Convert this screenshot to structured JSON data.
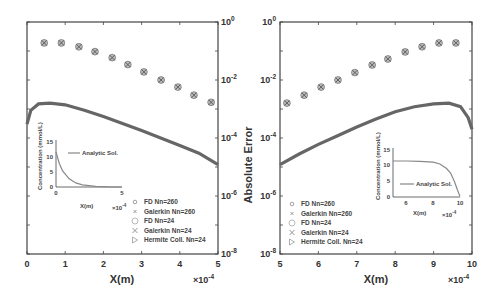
{
  "chart_data": [
    {
      "type": "scatter",
      "panel": "left",
      "xlabel": "X(m)",
      "x_multiplier": "×10^-4",
      "ylabel": "Absolute Error",
      "y_scale": "log",
      "xlim": [
        0,
        5
      ],
      "ylim": [
        1e-08,
        1
      ],
      "x_ticks": [
        "0",
        "1",
        "2",
        "3",
        "4",
        "5"
      ],
      "y_ticks": [
        "10^0",
        "10^-2",
        "10^-4",
        "10^-6",
        "10^-8"
      ],
      "legend": [
        "FD Nn=260",
        "Galerkin Nn=260",
        "FD Nn=24",
        "Galerkin Nn=24",
        "Hermite Coll. Nn=24"
      ],
      "legend_position": "lower right",
      "series": [
        {
          "name": "FD Nn=24 / Galerkin Nn=24 (overlapping)",
          "x": [
            0.45,
            0.9,
            1.36,
            1.78,
            2.23,
            2.64,
            3.06,
            3.51,
            3.95,
            4.37,
            4.82
          ],
          "y": [
            0.19,
            0.19,
            0.14,
            0.095,
            0.059,
            0.034,
            0.019,
            0.01,
            0.0057,
            0.003,
            0.0017
          ]
        },
        {
          "name": "FD Nn=260 / Galerkin Nn=260 / Hermite Coll. Nn=24 (dense curve)",
          "x": [
            0.0,
            0.1,
            0.3,
            0.6,
            1.0,
            1.5,
            2.0,
            2.5,
            3.0,
            3.5,
            4.0,
            4.5,
            5.0
          ],
          "y": [
            0.0003,
            0.0009,
            0.0015,
            0.0016,
            0.0014,
            0.0009,
            0.00055,
            0.00032,
            0.00018,
            0.0001,
            5.5e-05,
            3e-05,
            1.2e-05
          ]
        }
      ],
      "inset": {
        "xlabel": "X(m)",
        "x_multiplier": "×10^-4",
        "ylabel": "Concentration (mmol/L)",
        "x_ticks": [
          "0",
          "5"
        ],
        "y_ticks": [
          "0",
          "5",
          "10",
          "15"
        ],
        "legend": [
          "Analytic Sol."
        ],
        "curve": {
          "x": [
            0,
            0.25,
            0.5,
            1,
            1.5,
            2,
            3,
            4,
            5
          ],
          "y": [
            12,
            8,
            5.5,
            2.8,
            1.4,
            0.7,
            0.2,
            0.05,
            0.01
          ]
        }
      }
    },
    {
      "type": "scatter",
      "panel": "right",
      "xlabel": "X(m)",
      "x_multiplier": "×10^-4",
      "ylabel": "Absolute Error",
      "y_scale": "log",
      "xlim": [
        5,
        10
      ],
      "ylim": [
        1e-08,
        1
      ],
      "x_ticks": [
        "5",
        "6",
        "7",
        "8",
        "9",
        "10"
      ],
      "y_ticks": [
        "10^0",
        "10^-2",
        "10^-4",
        "10^-6",
        "10^-8"
      ],
      "legend": [
        "FD Nn=260",
        "Galerkin Nn=260",
        "FD Nn=24",
        "Galerkin Nn=24",
        "Hermite Coll. Nn=24"
      ],
      "legend_position": "lower left",
      "series": [
        {
          "name": "FD Nn=24 / Galerkin Nn=24 (overlapping)",
          "x": [
            5.18,
            5.63,
            6.07,
            6.51,
            6.95,
            7.4,
            7.81,
            8.26,
            8.7,
            9.14,
            9.58
          ],
          "y": [
            0.0016,
            0.003,
            0.0057,
            0.01,
            0.018,
            0.033,
            0.053,
            0.093,
            0.14,
            0.19,
            0.19
          ]
        },
        {
          "name": "FD Nn=260 / Galerkin Nn=260 / Hermite Coll. Nn=24 (dense curve)",
          "x": [
            5.0,
            5.5,
            6.0,
            6.5,
            7.0,
            7.5,
            8.0,
            8.5,
            9.0,
            9.4,
            9.7,
            9.9,
            10.0
          ],
          "y": [
            1.2e-05,
            2.8e-05,
            6e-05,
            0.00012,
            0.00024,
            0.00045,
            0.0008,
            0.0012,
            0.0015,
            0.0016,
            0.0012,
            0.0005,
            0.0002
          ]
        }
      ],
      "inset": {
        "xlabel": "X(m)",
        "x_multiplier": "×10^-4",
        "ylabel": "Concentration (mmol/L)",
        "x_ticks": [
          "6",
          "8",
          "10"
        ],
        "y_ticks": [
          "0",
          "5",
          "10",
          "15"
        ],
        "legend": [
          "Analytic Sol."
        ],
        "curve": {
          "x": [
            5,
            6,
            7,
            8,
            8.5,
            9,
            9.3,
            9.6,
            9.8,
            10
          ],
          "y": [
            12,
            12,
            11.9,
            11.6,
            11,
            9.5,
            8,
            5,
            2.5,
            0.2
          ]
        }
      }
    }
  ],
  "labels": {
    "left_xlabel": "X(m)",
    "right_xlabel": "X(m)",
    "shared_ylabel": "Absolute Error",
    "left_multiplier": "×10",
    "right_multiplier": "×10",
    "multiplier_exp": "-4",
    "ytick_base": "10",
    "ytick_exps": [
      "0",
      "-2",
      "-4",
      "-6",
      "-8"
    ],
    "left_xticks": [
      "0",
      "1",
      "2",
      "3",
      "4",
      "5"
    ],
    "right_xticks": [
      "5",
      "6",
      "7",
      "8",
      "9",
      "10"
    ],
    "legend": [
      "FD Nn=260",
      "Galerkin Nn=260",
      "FD Nn=24",
      "Galerkin Nn=24",
      "Hermite Coll. Nn=24"
    ],
    "inset_ylabel": "Concentration (mmol/L)",
    "inset_xlabel": "X(m)",
    "inset_legend": "Analytic Sol.",
    "inset_yticks": [
      "0",
      "5",
      "10",
      "15"
    ],
    "left_inset_xticks": [
      "0",
      "5"
    ],
    "right_inset_xticks": [
      "6",
      "8",
      "10"
    ]
  },
  "colors": {
    "frame": "#444444",
    "curve": "#666666",
    "marker": "#777777",
    "inset_curve": "#888888"
  }
}
